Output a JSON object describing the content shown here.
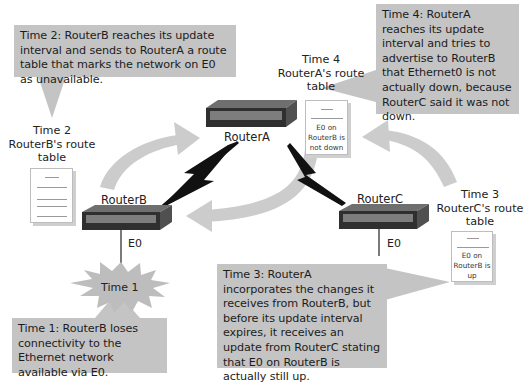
{
  "routers": {
    "a": {
      "name": "RouterA"
    },
    "b": {
      "name": "RouterB",
      "interface": "E0"
    },
    "c": {
      "name": "RouterC",
      "interface": "E0"
    }
  },
  "events": {
    "time1": {
      "burst_label": "Time 1",
      "description": "Time 1: RouterB loses connectivity to the Ethernet network available via E0."
    },
    "time2": {
      "description": "Time 2: RouterB reaches its update interval and sends to RouterA a route table that marks the network on E0 as unavailable.",
      "table_label": [
        "Time 2",
        "RouterB's route",
        "table"
      ]
    },
    "time3": {
      "description": "Time 3: RouterA incorporates the changes it receives from RouterB, but before its update interval expires, it receives an update from RouterC stating that E0 on RouterB is actually still up.",
      "table_label": [
        "Time 3",
        "RouterC's route",
        "table"
      ],
      "table_entry": [
        "E0 on",
        "RouterB is",
        "up"
      ]
    },
    "time4": {
      "description": "Time 4: RouterA reaches its update interval and tries to advertise to RouterB that Ethernet0 is not actually down, because RouterC said it was not down.",
      "table_label": [
        "Time 4",
        "RouterA's route",
        "table"
      ],
      "table_entry": [
        "E0 on",
        "RouterB is",
        "not down"
      ]
    }
  },
  "colors": {
    "callout_bg": "#c4c4c4",
    "arrow": "#cccccc",
    "burst": "#bdbdbd",
    "router_body": "#3a3a3a",
    "wan_link": "#111111"
  }
}
